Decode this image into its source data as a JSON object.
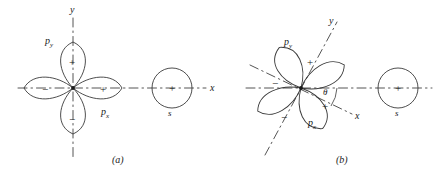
{
  "figure": {
    "title_hidden": "",
    "panels": [
      {
        "id": "a",
        "caption": "(a)",
        "origin": {
          "x": 73,
          "y": 88
        },
        "axes": [
          {
            "name": "y-axis",
            "label": "y",
            "label_x": 70,
            "label_y": 5,
            "style": "dash-dot",
            "orientation": "vertical"
          },
          {
            "name": "x-axis",
            "label": "x",
            "label_x": 210,
            "label_y": 83,
            "style": "dash-dot",
            "orientation": "horizontal"
          }
        ],
        "p_orbital": {
          "label_py": "p",
          "label_py_sub": "y",
          "label_py_x": 45,
          "label_py_y": 36,
          "label_px": "p",
          "label_px_sub": "x",
          "label_px_x": 101,
          "label_px_y": 107,
          "lobes": [
            {
              "name": "lobe-py-positive",
              "sign": "+",
              "direction": "up",
              "sign_x": 69,
              "sign_y": 57
            },
            {
              "name": "lobe-py-negative",
              "sign": "−",
              "direction": "down",
              "sign_x": 69,
              "sign_y": 114
            },
            {
              "name": "lobe-px-positive",
              "sign": "+",
              "direction": "right",
              "sign_x": 100,
              "sign_y": 84
            },
            {
              "name": "lobe-px-negative",
              "sign": "−",
              "direction": "left",
              "sign_x": 42,
              "sign_y": 84
            }
          ]
        },
        "s_orbital": {
          "name": "s-orbital",
          "label": "s",
          "label_x": 168,
          "label_y": 109,
          "sign": "+",
          "sign_x": 169,
          "sign_y": 83,
          "center_x": 172,
          "center_y": 88,
          "radius": 20
        }
      },
      {
        "id": "b",
        "caption": "(b)",
        "origin": {
          "x": 301,
          "y": 88
        },
        "rotation_deg": 30,
        "axes": [
          {
            "name": "y-axis-rotated",
            "label": "y",
            "label_x": 329,
            "label_y": 16,
            "style": "dash-dot",
            "orientation": "rotated"
          },
          {
            "name": "x-axis-rotated",
            "label": "x",
            "label_x": 355,
            "label_y": 111,
            "style": "dash-dot",
            "orientation": "rotated"
          },
          {
            "name": "x-axis-reference",
            "label": "",
            "label_x": 0,
            "label_y": 0,
            "style": "dash-dot",
            "orientation": "horizontal"
          }
        ],
        "angle_marker": {
          "name": "theta-angle",
          "label": "θ",
          "label_x": 323,
          "label_y": 88
        },
        "p_orbital": {
          "label_py": "p",
          "label_py_sub": "y",
          "label_py_x": 284,
          "label_py_y": 37,
          "label_px": "p",
          "label_px_sub": "x",
          "label_px_x": 308,
          "label_px_y": 118,
          "lobes": [
            {
              "name": "lobe-py-positive",
              "sign": "+",
              "direction": "up-right",
              "sign_x": 307,
              "sign_y": 57
            },
            {
              "name": "lobe-py-negative",
              "sign": "−",
              "direction": "down-left",
              "sign_x": 281,
              "sign_y": 112
            },
            {
              "name": "lobe-px-positive",
              "sign": "+",
              "direction": "right-down",
              "sign_x": 322,
              "sign_y": 101
            },
            {
              "name": "lobe-px-negative",
              "sign": "−",
              "direction": "left-up",
              "sign_x": 272,
              "sign_y": 78
            }
          ]
        },
        "s_orbital": {
          "name": "s-orbital",
          "label": "s",
          "label_x": 395,
          "label_y": 109,
          "sign": "+",
          "sign_x": 395,
          "sign_y": 83,
          "center_x": 398,
          "center_y": 88,
          "radius": 20
        }
      }
    ],
    "caption_a_x": 112,
    "caption_a_y": 155,
    "caption_b_x": 336,
    "caption_b_y": 155,
    "colors": {
      "stroke": "#3a3a3a",
      "axis": "#555555",
      "text": "#1a1a1a",
      "background": "#ffffff"
    }
  }
}
